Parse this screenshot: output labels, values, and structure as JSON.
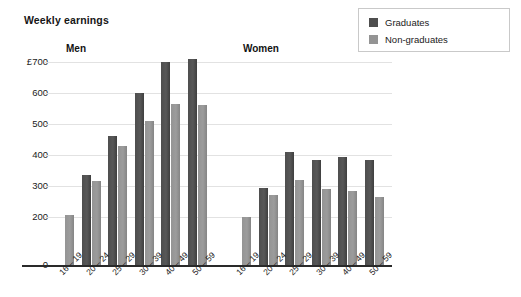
{
  "title": "Weekly earnings",
  "legend": {
    "items": [
      {
        "label": "Graduates",
        "color": "#4e4e4e",
        "key": "graduates"
      },
      {
        "label": "Non-graduates",
        "color": "#949494",
        "key": "non_graduates"
      }
    ]
  },
  "axis": {
    "y_ticks": [
      "£700",
      "600",
      "500",
      "400",
      "300",
      "200",
      "0"
    ],
    "y_values": [
      700,
      600,
      500,
      400,
      300,
      200,
      0
    ]
  },
  "groups": [
    {
      "name": "Men",
      "label": "Men"
    },
    {
      "name": "Women",
      "label": "Women"
    }
  ],
  "categories": [
    "16 – 19",
    "20 – 24",
    "25 – 29",
    "30 – 39",
    "40 – 49",
    "50 – 59"
  ],
  "chart_data": {
    "type": "bar",
    "title": "Weekly earnings",
    "xlabel": "",
    "ylabel": "£",
    "ylim": [
      0,
      730
    ],
    "grid": true,
    "legend_position": "top-right",
    "categories": [
      "16 – 19",
      "20 – 24",
      "25 – 29",
      "30 – 39",
      "40 – 49",
      "50 – 59"
    ],
    "panels": [
      {
        "name": "Men",
        "series": [
          {
            "name": "Graduates",
            "values": [
              0,
              335,
              460,
              600,
              700,
              710
            ]
          },
          {
            "name": "Non-graduates",
            "values": [
              205,
              315,
              430,
              510,
              565,
              560
            ]
          }
        ]
      },
      {
        "name": "Women",
        "series": [
          {
            "name": "Graduates",
            "values": [
              0,
              295,
              410,
              385,
              395,
              385
            ]
          },
          {
            "name": "Non-graduates",
            "values": [
              200,
              270,
              320,
              290,
              285,
              265
            ]
          }
        ]
      }
    ],
    "y_ticks": [
      0,
      200,
      300,
      400,
      500,
      600,
      700
    ],
    "y_tick_labels": [
      "0",
      "200",
      "300",
      "400",
      "500",
      "600",
      "£700"
    ]
  }
}
